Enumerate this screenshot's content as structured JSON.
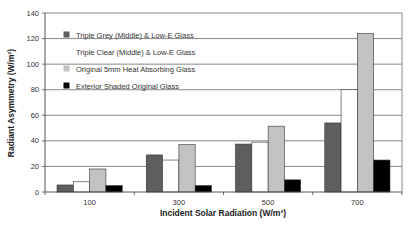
{
  "chart_data": {
    "type": "bar",
    "title": "",
    "xlabel": "Incident Solar Radiation (W/m²)",
    "ylabel": "Radiant Asymmetry (W/m²)",
    "categories": [
      "100",
      "300",
      "500",
      "700"
    ],
    "ylim": [
      0,
      140
    ],
    "yticks": [
      0,
      20,
      40,
      60,
      80,
      100,
      120,
      140
    ],
    "grid": true,
    "legend_position": "upper-left-inside",
    "series": [
      {
        "name": "Triple Grey (Middle) & Low-E Glass",
        "color": "#5e5e5e",
        "values": [
          5.5,
          29,
          37.5,
          54
        ]
      },
      {
        "name": "Triple Clear (Middle) & Low-E Glass",
        "color": "#ffffff",
        "values": [
          8,
          25,
          39,
          80
        ]
      },
      {
        "name": "Original 5mm Heat Absorbing Glass",
        "color": "#c2c2c2",
        "values": [
          18,
          37,
          51.5,
          124
        ]
      },
      {
        "name": "Exterior Shaded Original Glass",
        "color": "#000000",
        "values": [
          5,
          5,
          9.5,
          25
        ]
      }
    ]
  }
}
